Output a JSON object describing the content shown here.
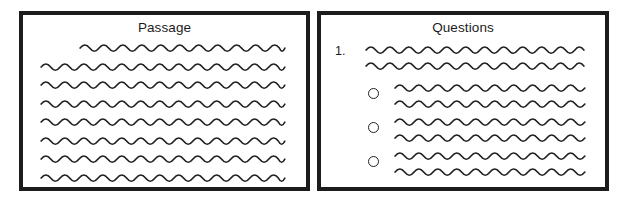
{
  "figure": {
    "background_color": "#ffffff",
    "ink_color": "#231f20",
    "border_color": "#1c1c1c"
  },
  "passage_panel": {
    "title": "Passage",
    "line_count": 8,
    "lines": [
      {
        "x": 76,
        "y": 44,
        "width": 205,
        "indented": true
      },
      {
        "x": 37,
        "y": 63,
        "width": 244,
        "indented": false
      },
      {
        "x": 37,
        "y": 81,
        "width": 244,
        "indented": false
      },
      {
        "x": 37,
        "y": 100,
        "width": 244,
        "indented": false
      },
      {
        "x": 37,
        "y": 118,
        "width": 244,
        "indented": false
      },
      {
        "x": 37,
        "y": 137,
        "width": 244,
        "indented": false
      },
      {
        "x": 37,
        "y": 155,
        "width": 244,
        "indented": false
      },
      {
        "x": 37,
        "y": 174,
        "width": 244,
        "indented": false
      }
    ]
  },
  "questions_panel": {
    "title": "Questions",
    "question_number": "1.",
    "question_number_position": {
      "x": 331,
      "y": 40
    },
    "question_lines": [
      {
        "x": 362,
        "y": 46,
        "width": 218
      },
      {
        "x": 362,
        "y": 62,
        "width": 218
      }
    ],
    "options": [
      {
        "bullet": {
          "x": 364,
          "y": 89
        },
        "lines": [
          {
            "x": 391,
            "y": 84,
            "width": 190
          },
          {
            "x": 391,
            "y": 100,
            "width": 190
          }
        ]
      },
      {
        "bullet": {
          "x": 364,
          "y": 123
        },
        "lines": [
          {
            "x": 391,
            "y": 118,
            "width": 190
          },
          {
            "x": 391,
            "y": 134,
            "width": 190
          }
        ]
      },
      {
        "bullet": {
          "x": 364,
          "y": 157
        },
        "lines": [
          {
            "x": 391,
            "y": 152,
            "width": 190
          },
          {
            "x": 391,
            "y": 168,
            "width": 190
          }
        ]
      }
    ],
    "option_count": 3
  },
  "wave": {
    "period": 19,
    "amplitude": 3.1
  }
}
